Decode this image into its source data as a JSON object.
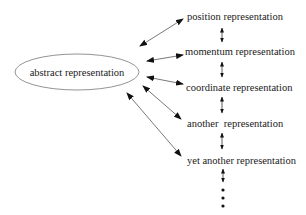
{
  "diagram": {
    "center_node": {
      "label": "abstract representation",
      "shape": "ellipse"
    },
    "representations": [
      {
        "label": "position representation"
      },
      {
        "label": "momentum representation"
      },
      {
        "label": "coordinate representation"
      },
      {
        "label": "another  representation"
      },
      {
        "label": "yet another representation"
      }
    ],
    "continuation": "more representations (vertical dots)",
    "colors": {
      "line": "#555555",
      "arrowhead": "#111111",
      "text": "#1a1a1a",
      "background": "#ffffff"
    }
  }
}
